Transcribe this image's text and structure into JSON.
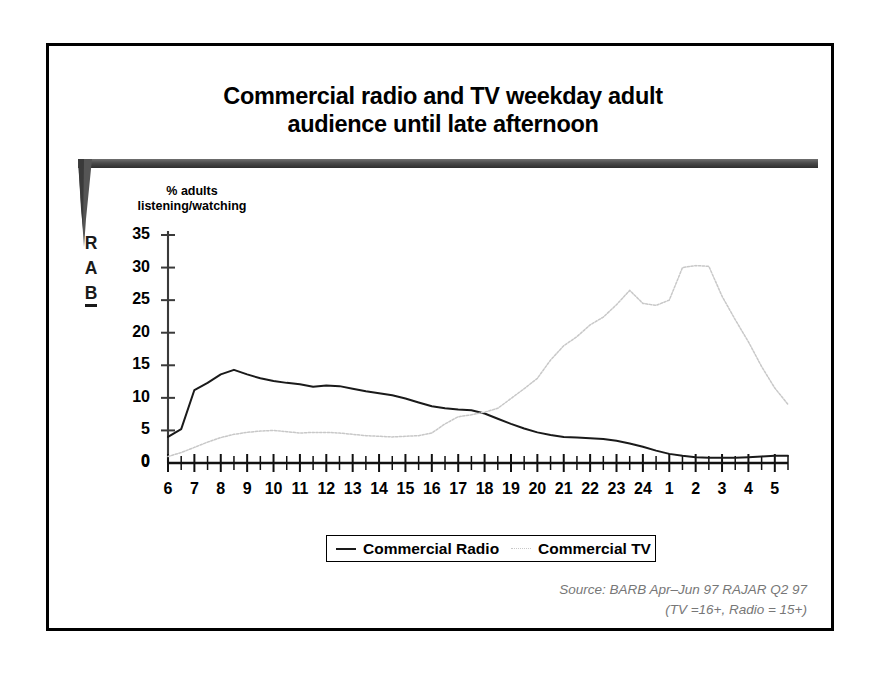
{
  "slide": {
    "title_line1": "Commercial radio and TV weekday adult",
    "title_line2": "audience until late afternoon",
    "brand": {
      "letters": [
        "R",
        "A",
        "B"
      ],
      "bar_color": "#4a4a4a"
    }
  },
  "legend": {
    "radio_label": "Commercial Radio",
    "tv_label": "Commercial TV",
    "radio_color": "#1a1a1a",
    "tv_color": "#c8c8c8"
  },
  "source": {
    "line1": "Source: BARB Apr–Jun 97 RAJAR Q2 97",
    "line2": "(TV =16+, Radio = 15+)"
  },
  "chart_data": {
    "type": "line",
    "title": "Commercial radio and TV weekday adult audience until late afternoon",
    "xlabel": "",
    "ylabel": "% adults listening/watching",
    "ylabel_line1": "% adults",
    "ylabel_line2": "listening/watching",
    "ylim": [
      0,
      35
    ],
    "yticks": [
      0,
      5,
      10,
      15,
      20,
      25,
      30,
      35
    ],
    "xticks": [
      6,
      7,
      8,
      9,
      10,
      11,
      12,
      13,
      14,
      15,
      16,
      17,
      18,
      19,
      20,
      21,
      22,
      23,
      24,
      1,
      2,
      3,
      4,
      5
    ],
    "x_tick_interval_hours": 0.5,
    "grid": false,
    "legend_position": "bottom",
    "x": [
      6,
      6.5,
      7,
      7.5,
      8,
      8.5,
      9,
      9.5,
      10,
      10.5,
      11,
      11.5,
      12,
      12.5,
      13,
      13.5,
      14,
      14.5,
      15,
      15.5,
      16,
      16.5,
      17,
      17.5,
      18,
      18.5,
      19,
      19.5,
      20,
      20.5,
      21,
      21.5,
      22,
      22.5,
      23,
      23.5,
      24,
      24.5,
      25,
      25.5,
      26,
      26.5,
      27,
      27.5,
      28,
      28.5,
      29,
      29.5
    ],
    "x_hour_labels": [
      "6",
      "6:30",
      "7",
      "7:30",
      "8",
      "8:30",
      "9",
      "9:30",
      "10",
      "10:30",
      "11",
      "11:30",
      "12",
      "12:30",
      "13",
      "13:30",
      "14",
      "14:30",
      "15",
      "15:30",
      "16",
      "16:30",
      "17",
      "17:30",
      "18",
      "18:30",
      "19",
      "19:30",
      "20",
      "20:30",
      "21",
      "21:30",
      "22",
      "22:30",
      "23",
      "23:30",
      "24",
      "0:30",
      "1",
      "1:30",
      "2",
      "2:30",
      "3",
      "3:30",
      "4",
      "4:30",
      "5",
      "5:30"
    ],
    "series": [
      {
        "name": "Commercial Radio",
        "color": "#1a1a1a",
        "style": "solid",
        "values": [
          4.0,
          5.2,
          11.2,
          12.3,
          13.6,
          14.3,
          13.6,
          13.0,
          12.6,
          12.3,
          12.1,
          11.7,
          11.9,
          11.8,
          11.4,
          11.0,
          10.7,
          10.4,
          9.9,
          9.3,
          8.7,
          8.4,
          8.2,
          8.1,
          7.6,
          6.8,
          6.0,
          5.3,
          4.7,
          4.3,
          4.0,
          3.9,
          3.8,
          3.7,
          3.4,
          3.0,
          2.5,
          1.9,
          1.4,
          1.1,
          0.9,
          0.8,
          0.8,
          0.8,
          0.9,
          1.0,
          1.1,
          1.1
        ]
      },
      {
        "name": "Commercial TV",
        "color": "#c8c8c8",
        "style": "dotted",
        "values": [
          1.0,
          1.6,
          2.4,
          3.2,
          3.9,
          4.4,
          4.7,
          4.9,
          5.0,
          4.8,
          4.6,
          4.7,
          4.7,
          4.6,
          4.4,
          4.2,
          4.1,
          4.0,
          4.1,
          4.2,
          4.6,
          6.0,
          7.1,
          7.4,
          7.8,
          8.4,
          9.9,
          11.4,
          13.0,
          15.8,
          18.0,
          19.4,
          21.2,
          22.4,
          24.3,
          26.5,
          24.5,
          24.2,
          25.0,
          30.0,
          30.3,
          30.2,
          25.6,
          22.0,
          18.6,
          14.8,
          11.5,
          9.0
        ],
        "values_tail": [
          7.2,
          4.5,
          3.0,
          2.1,
          4.0,
          1.6,
          1.1,
          0.9,
          0.8,
          0.8,
          0.8,
          0.8
        ]
      }
    ],
    "notes": {
      "radio_peak": {
        "hour": "8:30",
        "value": 14.3
      },
      "tv_peak": {
        "hour": "21",
        "value": 30.3
      },
      "tv_first_peak": {
        "hour": "20",
        "value": 26.5
      },
      "crossover_hour": "16:30",
      "tv_late_spike": {
        "hour": "2",
        "value": 4.0
      }
    }
  }
}
